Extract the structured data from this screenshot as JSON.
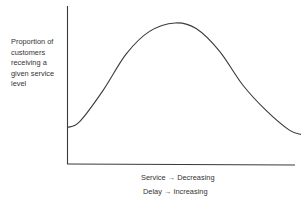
{
  "chart_data": {
    "type": "line",
    "title": "",
    "ylabel": "Proportion of customers receiving a given service level",
    "ylabel_lines": [
      "Proportion of",
      "customers",
      "receiving a",
      "given service",
      "level"
    ],
    "xlabel_lines": [
      "Service → Decreasing",
      "Delay  → Increasing"
    ],
    "xlabel": "Service → Decreasing / Delay → Increasing",
    "grid": false,
    "legend": null,
    "ticks": {
      "x": [],
      "y": []
    },
    "series": [
      {
        "name": "distribution",
        "description": "Bell-shaped curve; low at start, peak near middle, declining toward right",
        "x": [
          0,
          0.05,
          0.15,
          0.25,
          0.35,
          0.46,
          0.55,
          0.65,
          0.75,
          0.85,
          0.95,
          1.0
        ],
        "y": [
          0.26,
          0.3,
          0.52,
          0.78,
          0.94,
          1.0,
          0.96,
          0.8,
          0.56,
          0.38,
          0.24,
          0.21
        ]
      }
    ],
    "xlim": [
      0,
      1
    ],
    "ylim": [
      0,
      1.12
    ]
  },
  "colors": {
    "line": "#3a3a3a",
    "axis": "#3a3a3a",
    "text": "#333333"
  }
}
